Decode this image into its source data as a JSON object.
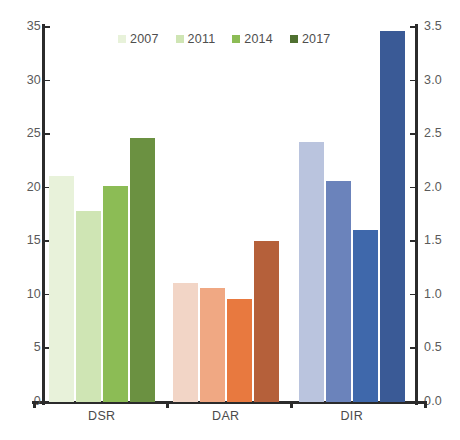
{
  "chart_data": {
    "type": "bar",
    "title": "",
    "subtitle": "",
    "xlabel": "",
    "ylabel": "",
    "categories": [
      "DSR",
      "DAR",
      "DIR"
    ],
    "legend_position": "top-center",
    "grid": false,
    "axes": {
      "left": {
        "label": "",
        "ylim": [
          0,
          35
        ],
        "ticks": [
          0,
          5,
          10,
          15,
          20,
          25,
          30,
          35
        ],
        "tick_labels": [
          "0",
          "5",
          "10",
          "15",
          "20",
          "25",
          "30",
          "35"
        ],
        "applies_to_categories": [
          "DSR",
          "DAR"
        ]
      },
      "right": {
        "label": "",
        "ylim": [
          0,
          3.5
        ],
        "ticks": [
          0.0,
          0.5,
          1.0,
          1.5,
          2.0,
          2.5,
          3.0,
          3.5
        ],
        "tick_labels": [
          "0.0",
          "0.5",
          "1.0",
          "1.5",
          "2.0",
          "2.5",
          "3.0",
          "3.5"
        ],
        "applies_to_categories": [
          "DIR"
        ]
      }
    },
    "series": [
      {
        "name": "2007",
        "values": [
          21.1,
          11.1,
          2.43
        ]
      },
      {
        "name": "2011",
        "values": [
          17.8,
          10.6,
          2.06
        ]
      },
      {
        "name": "2014",
        "values": [
          20.1,
          9.6,
          1.6
        ]
      },
      {
        "name": "2017",
        "values": [
          24.6,
          15.0,
          3.46
        ]
      }
    ],
    "group_colors": {
      "DSR": [
        "#e8f2da",
        "#cfe5b4",
        "#8cbc55",
        "#6b9141"
      ],
      "DAR": [
        "#f2d5c6",
        "#f0a883",
        "#e8793f",
        "#b5603a"
      ],
      "DIR": [
        "#bac4de",
        "#6b83bb",
        "#3f68ab",
        "#3a5a96"
      ]
    },
    "legend_colors": [
      "#e8f2da",
      "#cfe5b4",
      "#8cbc55",
      "#4f7030"
    ],
    "axis_color": "#2b2b2b",
    "tick_label_color": "#5a5a5a",
    "background": "#ffffff"
  }
}
